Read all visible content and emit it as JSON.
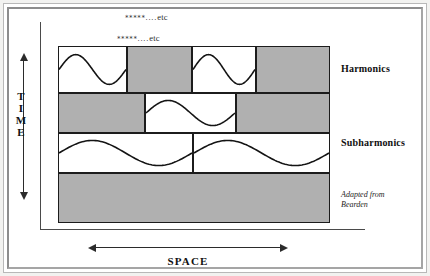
{
  "figure": {
    "title_etc_top": {
      "stars": "*****",
      "dots": "....",
      "word": "etc"
    },
    "title_etc_second": {
      "stars": "*****",
      "dots": "....",
      "word": "etc"
    },
    "axes": {
      "time_letters": [
        "T",
        "I",
        "M",
        "E"
      ],
      "time_label": "TIME",
      "space_label": "SPACE"
    },
    "labels": {
      "harmonics": "Harmonics",
      "subharmonics": "Subharmonics"
    },
    "credit": {
      "line1": "Adapted from",
      "line2": "Bearden"
    },
    "colors": {
      "shaded_cell": "#b0b0b0",
      "empty_cell": "#ffffff",
      "cell_border": "#1c1c1c",
      "axis": "#4a4a4a",
      "frame": "#8d8d8d",
      "background": "#ffffff"
    },
    "rows": [
      {
        "name": "row-harmonics-upper",
        "band": "Harmonics",
        "cells": [
          {
            "fill": "empty",
            "wave": "sine",
            "cycles": 1
          },
          {
            "fill": "shaded",
            "wave": "none",
            "cycles": 0
          },
          {
            "fill": "empty",
            "wave": "sine",
            "cycles": 1
          },
          {
            "fill": "shaded",
            "wave": "none",
            "cycles": 0
          }
        ]
      },
      {
        "name": "row-harmonics-lower",
        "band": "Harmonics",
        "cells": [
          {
            "fill": "shaded",
            "wave": "none",
            "cycles": 0
          },
          {
            "fill": "empty",
            "wave": "sine",
            "cycles": 1
          },
          {
            "fill": "shaded",
            "wave": "none",
            "cycles": 0
          }
        ]
      },
      {
        "name": "row-subharmonics-upper",
        "band": "Subharmonics",
        "cells": [
          {
            "fill": "empty",
            "wave": "sine",
            "cycles": 1
          },
          {
            "fill": "empty",
            "wave": "sine",
            "cycles": 1
          }
        ]
      },
      {
        "name": "row-subharmonics-lower",
        "band": "Subharmonics",
        "cells": [
          {
            "fill": "shaded",
            "wave": "none",
            "cycles": 0
          }
        ]
      }
    ]
  }
}
